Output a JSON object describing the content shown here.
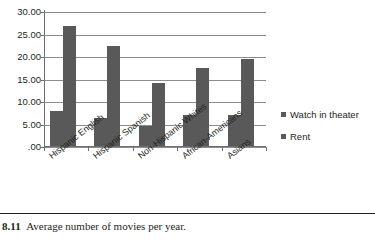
{
  "chart_data": {
    "type": "bar",
    "title": "",
    "xlabel": "",
    "ylabel": "",
    "categories": [
      "Hispanic English",
      "Hispanic Spanish",
      "Non-Hispanic Whites",
      "African-Americans",
      "Asians"
    ],
    "series": [
      {
        "name": "Watch in theater",
        "values": [
          8.1,
          6.5,
          4.7,
          7.2,
          7.1
        ],
        "color": "#595959"
      },
      {
        "name": "Rent",
        "values": [
          26.9,
          22.4,
          14.2,
          17.6,
          19.6
        ],
        "color": "#595959"
      }
    ],
    "ylim": [
      0,
      30
    ],
    "yticks": [
      0,
      5,
      10,
      15,
      20,
      25,
      30
    ],
    "ytick_labels": [
      ".00",
      "5.00",
      "10.00",
      "15.00",
      "20.00",
      "25.00",
      "30.00"
    ],
    "grid": true,
    "legend_position": "right"
  },
  "legend": {
    "entries": [
      {
        "label": "Watch in theater"
      },
      {
        "label": "Rent"
      }
    ]
  },
  "caption": {
    "number": "8.11",
    "text": "Average number of movies per year."
  }
}
